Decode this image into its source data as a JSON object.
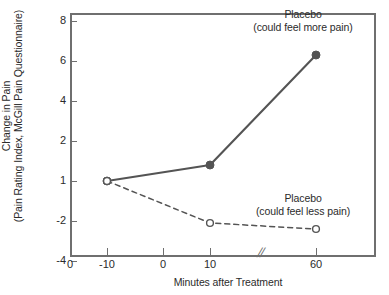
{
  "chart_data": {
    "type": "line",
    "title": "",
    "xlabel": "Minutes after Treatment",
    "ylabel": "Change in Pain (Pain Rating Index, McGill Pain Questionnaire)",
    "ylabel_lines": [
      "Change in Pain",
      "(Pain Rating Index, McGill Pain Questionnaire)"
    ],
    "grid": false,
    "legend_position": "inline-annotations",
    "x_axis": {
      "tick_labels": [
        "0",
        "-10",
        "0",
        "10",
        "60"
      ],
      "tick_values": [
        null,
        -10,
        0,
        10,
        60
      ],
      "origin_label": "0",
      "axis_break": "//",
      "axis_break_after": 10,
      "note": "axis is broken between 10 and 60 minutes"
    },
    "y_axis": {
      "tick_labels": [
        "8",
        "6",
        "4",
        "2",
        "1",
        "-2",
        "-4"
      ],
      "tick_values": [
        8,
        6,
        4,
        2,
        1,
        -2,
        -4
      ],
      "ylim": [
        -4,
        8
      ],
      "note": "tick marks are drawn at equal pixel spacing despite unequal numeric intervals"
    },
    "x": [
      -10,
      10,
      60
    ],
    "series": [
      {
        "name": "Placebo (could feel more pain)",
        "label_lines": [
          "Placebo",
          "(could feel more pain)"
        ],
        "values": [
          1,
          1.4,
          6.3
        ],
        "line_style": "solid",
        "marker": "filled-circle",
        "color": "#545454"
      },
      {
        "name": "Placebo (could feel less pain)",
        "label_lines": [
          "Placebo",
          "(could feel less pain)"
        ],
        "values": [
          1,
          -2.1,
          -2.4
        ],
        "line_style": "dashed",
        "marker": "open-circle",
        "color": "#545454"
      }
    ]
  },
  "axes": {
    "y_ticks": [
      {
        "label": "8",
        "top": 8
      },
      {
        "label": "6",
        "top": 48
      },
      {
        "label": "4",
        "top": 88
      },
      {
        "label": "2",
        "top": 128
      },
      {
        "label": "1",
        "top": 168
      },
      {
        "label": "-2",
        "top": 208
      },
      {
        "label": "-4",
        "top": 248
      }
    ],
    "x_ticks": [
      {
        "label": "-10",
        "left": 107
      },
      {
        "label": "0",
        "left": 163
      },
      {
        "label": "10",
        "left": 210
      },
      {
        "label": "60",
        "left": 316
      }
    ],
    "origin_label": "0",
    "axis_break_symbol": "//"
  },
  "annotations": {
    "more_pain": {
      "line1": "Placebo",
      "line2": "(could feel more pain)"
    },
    "less_pain": {
      "line1": "Placebo",
      "line2": "(could feel less pain)"
    }
  },
  "titles": {
    "y_line1": "Change in Pain",
    "y_line2": "(Pain Rating Index, McGill Pain Questionnaire)",
    "x": "Minutes after Treatment"
  },
  "colors": {
    "ink": "#2b2b2b",
    "axis": "#6f6f6f",
    "series": "#545454",
    "background": "#ffffff"
  }
}
